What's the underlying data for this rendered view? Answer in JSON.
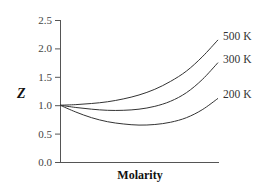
{
  "chart_data": {
    "type": "line",
    "title": "",
    "xlabel": "Molarity",
    "ylabel": "Z",
    "ylim": [
      0.0,
      2.5
    ],
    "yticks": [
      "0.0",
      "0.5",
      "1.0",
      "1.5",
      "2.0",
      "2.5"
    ],
    "xticks": [],
    "grid": false,
    "legend_position": "inline-right",
    "x": [
      0,
      0.1,
      0.2,
      0.3,
      0.4,
      0.5,
      0.6,
      0.7,
      0.8,
      0.9,
      1.0
    ],
    "series": [
      {
        "name": "500 K",
        "values": [
          1.0,
          1.01,
          1.03,
          1.06,
          1.11,
          1.18,
          1.28,
          1.42,
          1.6,
          1.85,
          2.15
        ]
      },
      {
        "name": "300 K",
        "values": [
          1.0,
          0.96,
          0.93,
          0.91,
          0.91,
          0.93,
          0.98,
          1.07,
          1.22,
          1.45,
          1.75
        ]
      },
      {
        "name": "200 K",
        "values": [
          1.0,
          0.88,
          0.78,
          0.71,
          0.67,
          0.65,
          0.66,
          0.7,
          0.78,
          0.92,
          1.12
        ]
      }
    ]
  }
}
